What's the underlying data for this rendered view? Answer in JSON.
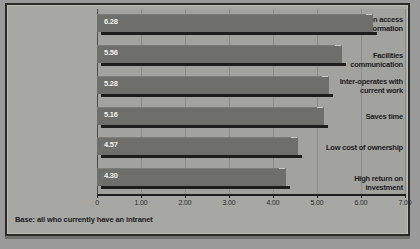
{
  "footer": {
    "base_note": "Base: all who currently have an intranet"
  },
  "chart_data": {
    "type": "bar",
    "orientation": "horizontal",
    "title": "",
    "subtitle": "",
    "xlabel": "",
    "ylabel": "",
    "categories": [
      "Allow common access to information",
      "Facilities communication",
      "Inter-operates with current work",
      "Saves time",
      "Low cost of ownership",
      "High return on investment"
    ],
    "values": [
      6.28,
      5.56,
      5.28,
      5.16,
      4.57,
      4.3
    ],
    "value_labels": [
      "6.28",
      "5.56",
      "5.28",
      "5.16",
      "4.57",
      "4.30"
    ],
    "xlim": [
      0,
      7
    ],
    "xticks": [
      0,
      1,
      2,
      3,
      4,
      5,
      6,
      7
    ],
    "xticklabels": [
      "0",
      "1.00",
      "2.00",
      "3.00",
      "4.00",
      "5.00",
      "6.00",
      "7.00"
    ],
    "grid": "vertical",
    "legend": "none",
    "bar_color": "#6e6e6b",
    "plot_background": "#a2a29f",
    "panel_background": "#a7a7a4",
    "axis_color": "#1e1e1e",
    "value_label_color": "#f2f2ef",
    "category_label_color": "#1c1c1c"
  }
}
